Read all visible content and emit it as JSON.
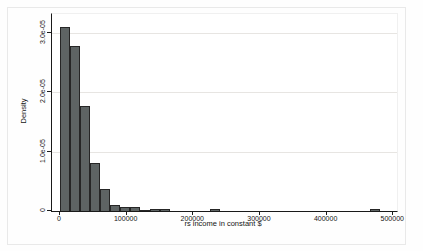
{
  "figure": {
    "background_color": "#fefefe",
    "frame_color": "#e9e9e9"
  },
  "chart_data": {
    "type": "bar",
    "subtype": "histogram",
    "title": "",
    "xlabel": "rs income in constant $",
    "ylabel": "Density",
    "grid": true,
    "legend": "none",
    "xlim": [
      0,
      505000
    ],
    "ylim": [
      0,
      3.32e-05
    ],
    "bar_color": "#5e6464",
    "bar_border_color": "#262626",
    "gridline_color": "#e7e5e2",
    "axis_color": "#1a1a1a",
    "x_ticks": [
      {
        "value": 0,
        "label": "0"
      },
      {
        "value": 100000,
        "label": "100000"
      },
      {
        "value": 200000,
        "label": "200000"
      },
      {
        "value": 300000,
        "label": "300000"
      },
      {
        "value": 400000,
        "label": "400000"
      },
      {
        "value": 500000,
        "label": "500000"
      }
    ],
    "y_ticks": [
      {
        "value": 0,
        "label": "0"
      },
      {
        "value": 1e-05,
        "label": "1.0e-05"
      },
      {
        "value": 2e-05,
        "label": "2.0e-05"
      },
      {
        "value": 3e-05,
        "label": "3.0e-05"
      }
    ],
    "bins": {
      "start": 0,
      "width": 15000,
      "densities": [
        3.1e-05,
        2.77e-05,
        1.76e-05,
        8.1e-06,
        3.7e-06,
        1e-06,
        6e-07,
        7e-07,
        2e-07,
        4e-07,
        4e-07,
        0,
        0,
        0,
        0,
        4e-07,
        0,
        0,
        0,
        0,
        0,
        0,
        0,
        0,
        0,
        0,
        0,
        0,
        0,
        0,
        0,
        3e-07
      ]
    }
  }
}
